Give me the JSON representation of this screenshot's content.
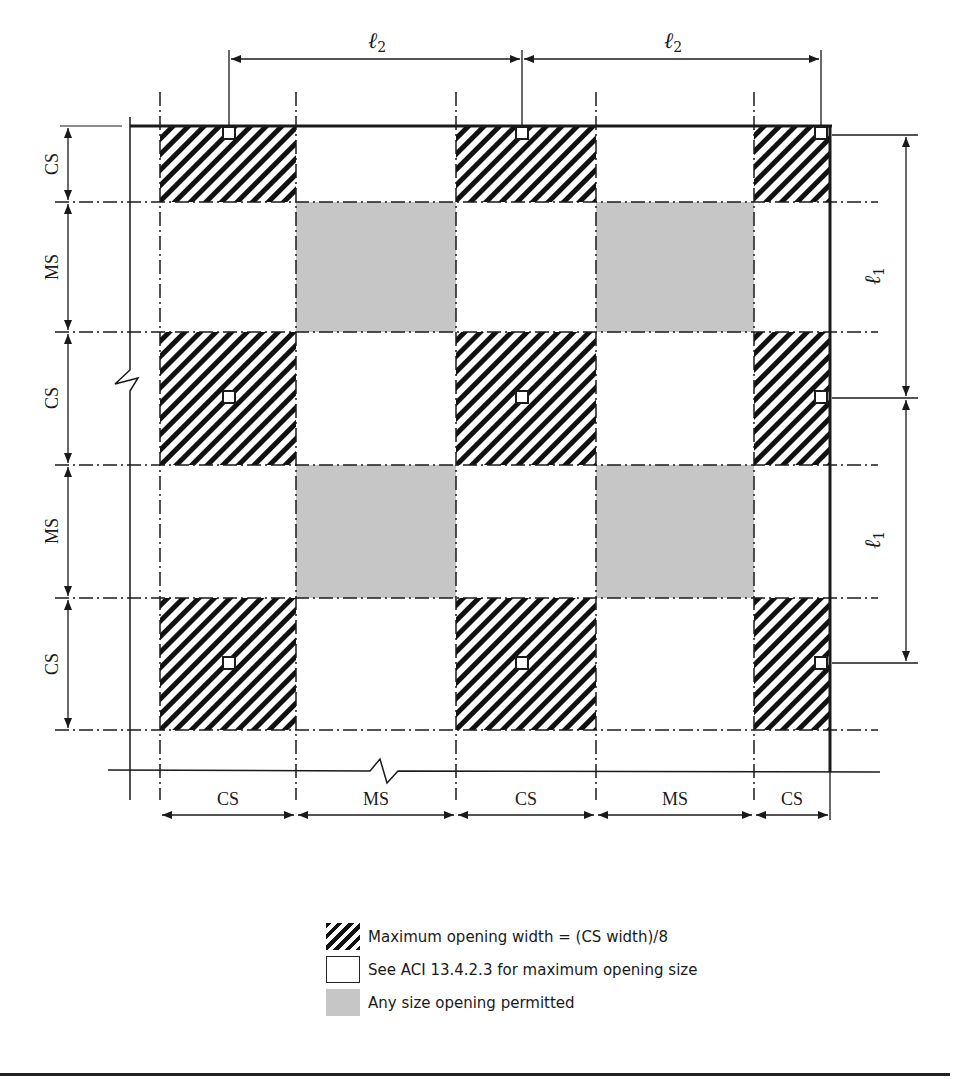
{
  "diagram": {
    "dimensions": {
      "top": [
        {
          "label": "ℓ",
          "subscript": "2"
        },
        {
          "label": "ℓ",
          "subscript": "2"
        }
      ],
      "right": [
        {
          "label": "ℓ",
          "subscript": "1"
        },
        {
          "label": "ℓ",
          "subscript": "1"
        }
      ]
    },
    "left_strips": [
      "CS",
      "MS",
      "CS",
      "MS",
      "CS"
    ],
    "bottom_strips": [
      "CS",
      "MS",
      "CS",
      "MS",
      "CS"
    ],
    "grid_x": [
      160,
      296,
      456,
      596,
      754,
      830
    ],
    "grid_y": [
      126,
      202,
      332,
      465,
      598,
      730
    ],
    "zone_grid": [
      [
        "hatched",
        "empty",
        "hatched",
        "empty",
        "hatched"
      ],
      [
        "empty",
        "gray",
        "empty",
        "gray",
        "empty"
      ],
      [
        "hatched",
        "empty",
        "hatched",
        "empty",
        "hatched"
      ],
      [
        "empty",
        "gray",
        "empty",
        "gray",
        "empty"
      ],
      [
        "hatched",
        "empty",
        "hatched",
        "empty",
        "hatched"
      ]
    ],
    "columns": [
      {
        "row": 0,
        "col": 0
      },
      {
        "row": 0,
        "col": 1
      },
      {
        "row": 0,
        "col": 2
      },
      {
        "row": 1,
        "col": 0
      },
      {
        "row": 1,
        "col": 1
      },
      {
        "row": 1,
        "col": 2
      },
      {
        "row": 2,
        "col": 0
      },
      {
        "row": 2,
        "col": 1
      },
      {
        "row": 2,
        "col": 2
      }
    ],
    "colors": {
      "line": "#1a1a1a",
      "gray_zone": "#c6c6c6",
      "hatch": "#111111",
      "background": "#ffffff"
    }
  },
  "legend": {
    "items": [
      {
        "swatch": "hatched",
        "text": "Maximum opening width = (CS width)/8"
      },
      {
        "swatch": "empty",
        "text": "See ACI 13.4.2.3 for maximum opening size"
      },
      {
        "swatch": "gray",
        "text": "Any size opening permitted"
      }
    ]
  }
}
